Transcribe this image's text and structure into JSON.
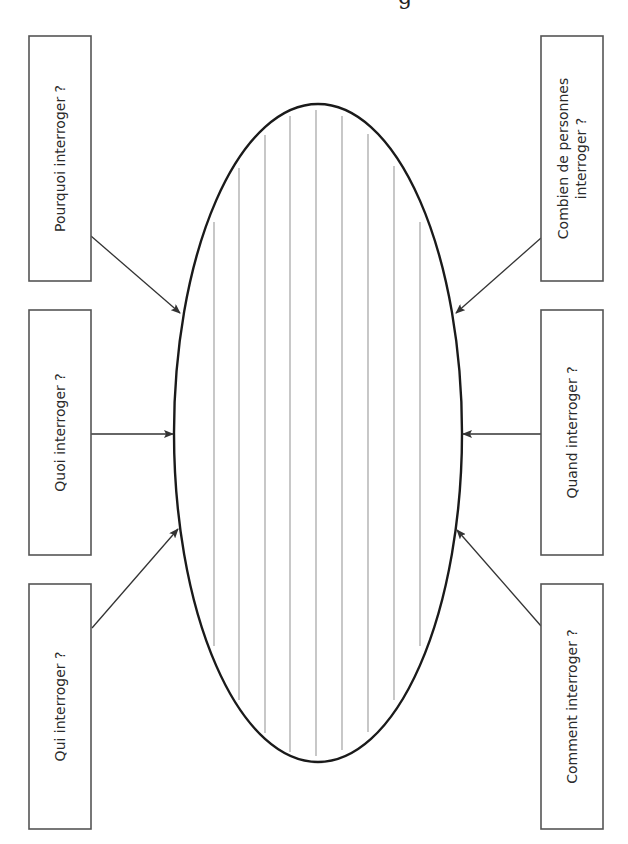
{
  "diagram": {
    "type": "mind-map worksheet (rotated 90°)",
    "top_partial_glyph": "g",
    "center": {
      "shape": "ellipse",
      "writing_lines": 9,
      "colors": {
        "outline": "#1a1a1a",
        "lines": "#9a9a9a"
      }
    },
    "boxes": {
      "left_top": {
        "label": "Pourquoi interroger ?"
      },
      "left_middle": {
        "label": "Quoi interroger ?"
      },
      "left_bottom": {
        "label": "Qui interroger ?"
      },
      "right_top": {
        "label_line1": "Combien de personnes",
        "label_line2": "interroger ?"
      },
      "right_middle": {
        "label": "Quand interroger ?"
      },
      "right_bottom": {
        "label": "Comment interroger ?"
      }
    },
    "colors": {
      "box_border": "#555555",
      "arrow": "#333333",
      "text": "#2a2a2a",
      "background": "#ffffff"
    }
  }
}
